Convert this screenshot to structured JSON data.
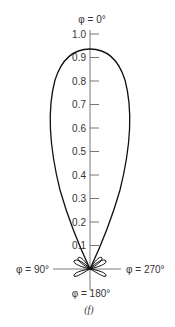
{
  "diagram": {
    "type": "polar radiation pattern",
    "caption": "(f)",
    "angle_labels": {
      "top": "φ = 0°",
      "left": "φ = 90°",
      "right": "φ = 270°",
      "bottom": "φ = 180°"
    },
    "radial_ticks": [
      "1.0",
      "0.9",
      "0.8",
      "0.7",
      "0.6",
      "0.5",
      "0.4",
      "0.3",
      "0.2",
      "0.1"
    ],
    "main_lobe_peak": 0.93,
    "colors": {
      "curve": "#111111",
      "axis": "#555555",
      "text": "#333333"
    }
  }
}
